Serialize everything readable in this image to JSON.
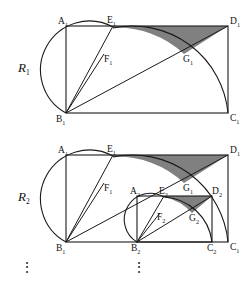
{
  "figure": {
    "background_color": "#ffffff",
    "stroke_color": "#1a1a1a",
    "shade_color": "#808080",
    "stages": [
      {
        "name": "stage-1",
        "label": "R",
        "subscript": "1"
      },
      {
        "name": "stage-2",
        "label": "R",
        "subscript": "2"
      }
    ],
    "continuation": {
      "symbol_left": "⋮",
      "symbol_right": "⋮"
    }
  },
  "stage1": {
    "vertices": [
      {
        "name": "A1",
        "letter": "A",
        "subscript": "1",
        "x": 66,
        "y": 26,
        "label_x": 58,
        "label_y": 24
      },
      {
        "name": "E1",
        "letter": "E",
        "subscript": "1",
        "x": 113,
        "y": 26,
        "label_x": 107,
        "label_y": 23
      },
      {
        "name": "D1",
        "letter": "D",
        "subscript": "1",
        "x": 228,
        "y": 26,
        "label_x": 230,
        "label_y": 24
      },
      {
        "name": "F1",
        "letter": "F",
        "subscript": "1",
        "x": 104,
        "y": 54,
        "label_x": 104,
        "label_y": 62
      },
      {
        "name": "G1",
        "letter": "G",
        "subscript": "1",
        "x": 184,
        "y": 54,
        "label_x": 183,
        "label_y": 62
      },
      {
        "name": "B1",
        "letter": "B",
        "subscript": "1",
        "x": 66,
        "y": 113,
        "label_x": 56,
        "label_y": 122
      },
      {
        "name": "C1",
        "letter": "C",
        "subscript": "1",
        "x": 228,
        "y": 113,
        "label_x": 230,
        "label_y": 121
      }
    ],
    "rect": {
      "x": 66,
      "y": 26,
      "w": 162,
      "h": 87
    },
    "diagonal": "M66,113 L228,26",
    "ray_to_E": "M66,113 L113,26",
    "ray_to_F": "M66,113 L104,54",
    "arc_big": "M113,28 A 96 96 0 0 1 228,113",
    "arc_small": "M66,113 A 48 48 0 0 1 113,27",
    "shaded": "M113,26 L228,26 L184,54 A 96 96 0 0 0 113,28 Z",
    "stage_label_x": 18,
    "stage_label_y": 72
  },
  "stage2": {
    "vertices": [
      {
        "name": "A1",
        "letter": "A",
        "subscript": "1",
        "x": 66,
        "y": 155,
        "label_x": 58,
        "label_y": 153
      },
      {
        "name": "E1",
        "letter": "E",
        "subscript": "1",
        "x": 113,
        "y": 155,
        "label_x": 107,
        "label_y": 152
      },
      {
        "name": "D1",
        "letter": "D",
        "subscript": "1",
        "x": 228,
        "y": 155,
        "label_x": 230,
        "label_y": 153
      },
      {
        "name": "F1",
        "letter": "F",
        "subscript": "1",
        "x": 104,
        "y": 183,
        "label_x": 104,
        "label_y": 191
      },
      {
        "name": "G1",
        "letter": "G",
        "subscript": "1",
        "x": 184,
        "y": 183,
        "label_x": 183,
        "label_y": 191
      },
      {
        "name": "A2",
        "letter": "A",
        "subscript": "2",
        "x": 137,
        "y": 196,
        "label_x": 130,
        "label_y": 194
      },
      {
        "name": "E2",
        "letter": "E",
        "subscript": "2",
        "x": 164,
        "y": 196,
        "label_x": 159,
        "label_y": 194
      },
      {
        "name": "D2",
        "letter": "D",
        "subscript": "2",
        "x": 212,
        "y": 196,
        "label_x": 212,
        "label_y": 194
      },
      {
        "name": "F2",
        "letter": "F",
        "subscript": "2",
        "x": 160,
        "y": 213,
        "label_x": 157,
        "label_y": 220
      },
      {
        "name": "G2",
        "letter": "G",
        "subscript": "2",
        "x": 192,
        "y": 213,
        "label_x": 189,
        "label_y": 221
      },
      {
        "name": "B1",
        "letter": "B",
        "subscript": "1",
        "x": 66,
        "y": 242,
        "label_x": 56,
        "label_y": 251
      },
      {
        "name": "B2",
        "letter": "B",
        "subscript": "2",
        "x": 137,
        "y": 242,
        "label_x": 131,
        "label_y": 251
      },
      {
        "name": "C2",
        "letter": "C",
        "subscript": "2",
        "x": 212,
        "y": 242,
        "label_x": 207,
        "label_y": 251
      },
      {
        "name": "C1",
        "letter": "C",
        "subscript": "1",
        "x": 228,
        "y": 242,
        "label_x": 230,
        "label_y": 250
      }
    ],
    "outer_rect": {
      "x": 66,
      "y": 155,
      "w": 162,
      "h": 87
    },
    "inner_rect": {
      "x": 137,
      "y": 196,
      "w": 75,
      "h": 46
    },
    "diagonal": "M66,242 L228,155",
    "ray_to_E": "M66,242 L113,155",
    "ray_to_F": "M66,242 L104,183",
    "arc_big": "M113,157 A 96 96 0 0 1 228,242",
    "arc_small": "M66,242 A 48 48 0 0 1 113,156",
    "shaded_outer": "M113,155 L228,155 L184,183 A 96 96 0 0 0 113,157 Z",
    "inner_diagonal": "M137,242 L212,196",
    "inner_ray_to_E": "M137,242 L164,196",
    "inner_ray_to_F": "M137,242 L160,213",
    "inner_arc_big": "M164,197 A 51 51 0 0 1 212,242",
    "inner_arc_small": "M137,242 A 26 26 0 0 1 164,197",
    "shaded_inner": "M164,196 L212,196 L192,213 A 51 51 0 0 0 164,197 Z",
    "stage_label_x": 18,
    "stage_label_y": 201
  },
  "ellipsis": {
    "left": {
      "text": "⋮",
      "x": 27,
      "y": 272
    },
    "right": {
      "text": "⋮",
      "x": 139,
      "y": 272
    }
  }
}
